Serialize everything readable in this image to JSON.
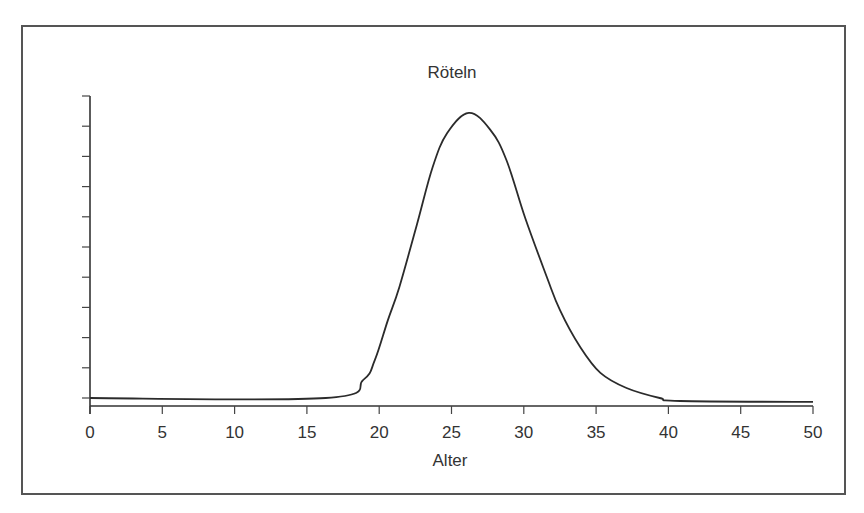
{
  "chart_data": {
    "type": "line",
    "title": "Röteln",
    "xlabel": "Alter",
    "ylabel": "",
    "xlim": [
      0,
      50
    ],
    "ylim": [
      0,
      10
    ],
    "x_ticks": [
      0,
      5,
      10,
      15,
      20,
      25,
      30,
      35,
      40,
      45,
      50
    ],
    "x_tick_labels": [
      "0",
      "5",
      "10",
      "15",
      "20",
      "25",
      "30",
      "35",
      "40",
      "45",
      "50"
    ],
    "y_tick_count": 10,
    "y_tick_labels": [],
    "grid": false,
    "legend": null,
    "series": [
      {
        "name": "Röteln",
        "x": [
          0,
          16.3,
          18.9,
          19.7,
          20.6,
          21.4,
          22.6,
          23.7,
          24.7,
          26.2,
          27.7,
          28.8,
          30.1,
          31.6,
          32.5,
          33.9,
          35.3,
          37.1,
          39.4,
          40.8,
          50
        ],
        "values": [
          0,
          0,
          0.6,
          1.26,
          2.58,
          3.68,
          5.73,
          7.65,
          8.77,
          9.44,
          8.87,
          7.88,
          5.96,
          4.0,
          2.91,
          1.69,
          0.83,
          0.33,
          0.0,
          -0.1,
          -0.13
        ]
      }
    ]
  },
  "labels": {
    "title": "Röteln",
    "xlabel": "Alter"
  },
  "colors": {
    "line": "#2b2b2b",
    "axis": "#333333",
    "frame": "#555555",
    "background": "#ffffff"
  }
}
